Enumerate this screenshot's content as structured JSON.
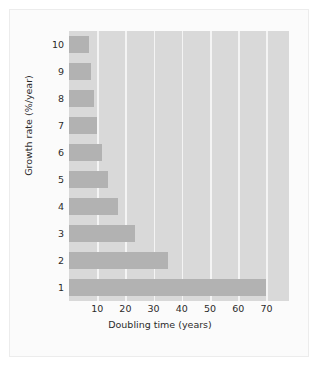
{
  "chart_data": {
    "type": "bar",
    "orientation": "horizontal",
    "title": "",
    "xlabel": "Doubling time (years)",
    "ylabel": "Growth rate (%/year)",
    "categories": [
      "10",
      "9",
      "8",
      "7",
      "6",
      "5",
      "4",
      "3",
      "2",
      "1"
    ],
    "values": [
      7,
      7.8,
      8.75,
      10,
      11.7,
      14,
      17.5,
      23.3,
      35,
      70
    ],
    "xticks": [
      10,
      20,
      30,
      40,
      50,
      60,
      70
    ],
    "xlim": [
      0,
      78
    ],
    "grid": "vertical-white",
    "legend": "none",
    "colors": {
      "bar": "#b2b2b2",
      "plot_background": "#d9d9d9",
      "gridline": "#f4f4f4",
      "card_background": "#fbfbfb",
      "card_border": "#ececec",
      "text": "#2b2b2b"
    }
  }
}
